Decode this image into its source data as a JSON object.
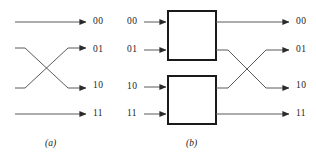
{
  "figure": {
    "width": 316,
    "height": 164,
    "background": "#ffffff",
    "line_color": "#4d4d4d",
    "box_stroke_color": "#1a1a1a",
    "text_color": "#1a1a1a"
  },
  "panel_a": {
    "caption": "(a)",
    "outputs": [
      {
        "label": "00",
        "y": 22
      },
      {
        "label": "01",
        "y": 50
      },
      {
        "label": "10",
        "y": 86
      },
      {
        "label": "11",
        "y": 114
      }
    ],
    "wires": [
      {
        "name": "straight-top",
        "from_y": 22,
        "to_y": 22,
        "crossing": false
      },
      {
        "name": "cross-upper",
        "from_y": 50,
        "to_y": 86,
        "crossing": true
      },
      {
        "name": "cross-lower",
        "from_y": 86,
        "to_y": 50,
        "crossing": true
      },
      {
        "name": "straight-bottom",
        "from_y": 114,
        "to_y": 114,
        "crossing": false
      }
    ]
  },
  "panel_b": {
    "caption": "(b)",
    "inputs": [
      {
        "label": "00",
        "y": 22
      },
      {
        "label": "01",
        "y": 50
      },
      {
        "label": "10",
        "y": 86
      },
      {
        "label": "11",
        "y": 114
      }
    ],
    "outputs": [
      {
        "label": "00",
        "y": 22
      },
      {
        "label": "01",
        "y": 50
      },
      {
        "label": "10",
        "y": 86
      },
      {
        "label": "11",
        "y": 114
      }
    ],
    "boxes": [
      {
        "name": "upper-box",
        "x": 168,
        "y": 11,
        "width": 48,
        "height": 49
      },
      {
        "name": "lower-box",
        "x": 168,
        "y": 76,
        "width": 48,
        "height": 48
      }
    ],
    "wires": [
      {
        "name": "out-straight-top",
        "from_y": 22,
        "to_y": 22,
        "crossing": false
      },
      {
        "name": "out-cross-upper",
        "from_y": 50,
        "to_y": 86,
        "crossing": true
      },
      {
        "name": "out-cross-lower",
        "from_y": 86,
        "to_y": 50,
        "crossing": true
      },
      {
        "name": "out-straight-bottom",
        "from_y": 114,
        "to_y": 114,
        "crossing": false
      }
    ]
  }
}
